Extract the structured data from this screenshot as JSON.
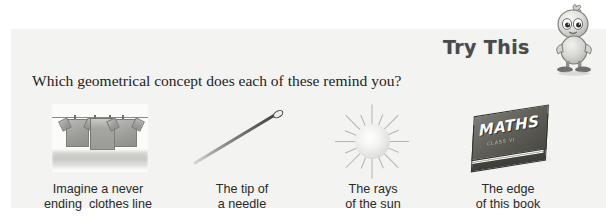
{
  "panel": {
    "header_label": "Try This",
    "mascot_name": "duckling-mascot",
    "question": "Which geometrical concept does each of these remind you?",
    "ghost_text_top": "Geometry",
    "ghost_text_sub": "Understanding Elementary Shapes"
  },
  "items": [
    {
      "id": "clothesline",
      "figure": "clothes-line-illustration",
      "caption_line1": "Imagine a never",
      "caption_line2": "ending  clothes line"
    },
    {
      "id": "needle",
      "figure": "needle-illustration",
      "caption_line1": "The tip of",
      "caption_line2": "a needle"
    },
    {
      "id": "sun",
      "figure": "sun-illustration",
      "caption_line1": "The rays",
      "caption_line2": "of the sun"
    },
    {
      "id": "book",
      "figure": "book-illustration",
      "caption_line1": "The edge",
      "caption_line2": "of this book",
      "book_title": "MATHS",
      "book_subtitle": "CLASS VI"
    }
  ],
  "colors": {
    "page_background": "#ffffff",
    "panel_background": "#f3f3f1",
    "header_text": "#4a4a4a",
    "body_text": "#1d1d1d",
    "caption_text": "#2a2a2a"
  }
}
